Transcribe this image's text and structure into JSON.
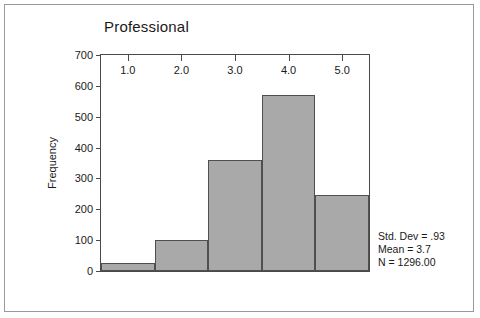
{
  "chart_data": {
    "type": "bar",
    "title": "Professional",
    "xlabel": "",
    "ylabel": "Frequency",
    "ylim": [
      0,
      700
    ],
    "xlim": [
      0.5,
      5.5
    ],
    "grid": false,
    "legend": "none",
    "bin_width": 1.0,
    "categories": [
      "0.5-1.5",
      "1.5-2.5",
      "2.5-3.5",
      "3.5-4.5",
      "4.5-5.5"
    ],
    "bin_edges": [
      0.5,
      1.5,
      2.5,
      3.5,
      4.5,
      5.5
    ],
    "values": [
      25,
      100,
      360,
      570,
      245
    ],
    "bars": [
      {
        "x0": 0.5,
        "x1": 1.5,
        "value": 25
      },
      {
        "x0": 1.5,
        "x1": 2.5,
        "value": 100
      },
      {
        "x0": 2.5,
        "x1": 3.5,
        "value": 360
      },
      {
        "x0": 3.5,
        "x1": 4.5,
        "value": 570
      },
      {
        "x0": 4.5,
        "x1": 5.5,
        "value": 245
      }
    ],
    "y_ticks": [
      0,
      100,
      200,
      300,
      400,
      500,
      600,
      700
    ],
    "y_tick_labels": [
      "0",
      "100",
      "200",
      "300",
      "400",
      "500",
      "600",
      "700"
    ],
    "x_ticks": [
      1.0,
      2.0,
      3.0,
      4.0,
      5.0
    ],
    "x_tick_labels": [
      "1.0",
      "2.0",
      "3.0",
      "4.0",
      "5.0"
    ],
    "annotations": [
      "Std. Dev = .93",
      "Mean = 3.7",
      "N = 1296.00"
    ],
    "colors": {
      "bar_fill": "#a9a9a9",
      "bar_border": "#4f4f4f",
      "axis": "#4a4a4a",
      "text": "#1a1a1a",
      "background": "#ffffff",
      "frame": "#9a9a9a"
    }
  },
  "stats": {
    "std_dev": "Std. Dev = .93",
    "mean": "Mean = 3.7",
    "n": "N = 1296.00"
  }
}
